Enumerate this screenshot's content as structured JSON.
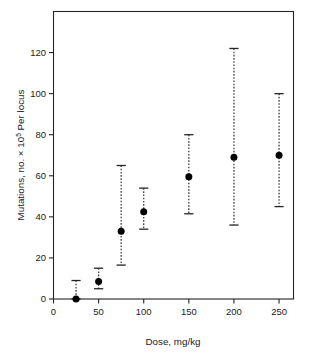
{
  "figure": {
    "title": "",
    "background": "#ffffff",
    "frame_color": "#242424",
    "marker_color": "#000000",
    "errorbar_color": "#3a3a3a"
  },
  "axes": {
    "x": {
      "label": "Dose, mg/kg",
      "ticks": [
        0,
        50,
        100,
        150,
        200,
        250
      ],
      "tick_labels": [
        "0",
        "50",
        "100",
        "150",
        "200",
        "250"
      ],
      "min": 0,
      "max": 266
    },
    "y": {
      "label_part1": "Mutations, no. ",
      "label_times": "× 10",
      "label_exp": "5",
      "label_part2": " Per locus",
      "label_full": "Mutations, no. × 10⁵ Per locus",
      "ticks": [
        0,
        20,
        40,
        60,
        80,
        100,
        120
      ],
      "tick_labels": [
        "0",
        "20",
        "40",
        "60",
        "80",
        "100",
        "120"
      ],
      "min": 0,
      "max": 140
    }
  },
  "chart_data": {
    "type": "scatter",
    "title": "",
    "xlabel": "Dose, mg/kg",
    "ylabel": "Mutations, no. × 10⁵ Per locus",
    "xlim": [
      0,
      266
    ],
    "ylim": [
      0,
      140
    ],
    "grid": false,
    "legend": "none",
    "errorbars": "vertical, dashed with caps",
    "x": [
      25,
      50,
      75,
      100,
      150,
      200,
      250
    ],
    "values": [
      0,
      8.5,
      33,
      42.5,
      59.5,
      69,
      70
    ],
    "y_lower": [
      0,
      5,
      16.5,
      34,
      41.5,
      36,
      45
    ],
    "y_upper": [
      9,
      15,
      65,
      54,
      80,
      122,
      100
    ],
    "points": [
      {
        "dose": 25,
        "mutations": 0,
        "lower": 0,
        "upper": 9
      },
      {
        "dose": 50,
        "mutations": 8.5,
        "lower": 5,
        "upper": 15
      },
      {
        "dose": 75,
        "mutations": 33,
        "lower": 16.5,
        "upper": 65
      },
      {
        "dose": 100,
        "mutations": 42.5,
        "lower": 34,
        "upper": 54
      },
      {
        "dose": 150,
        "mutations": 59.5,
        "lower": 41.5,
        "upper": 80
      },
      {
        "dose": 200,
        "mutations": 69,
        "lower": 36,
        "upper": 122
      },
      {
        "dose": 250,
        "mutations": 70,
        "lower": 45,
        "upper": 100
      }
    ]
  }
}
